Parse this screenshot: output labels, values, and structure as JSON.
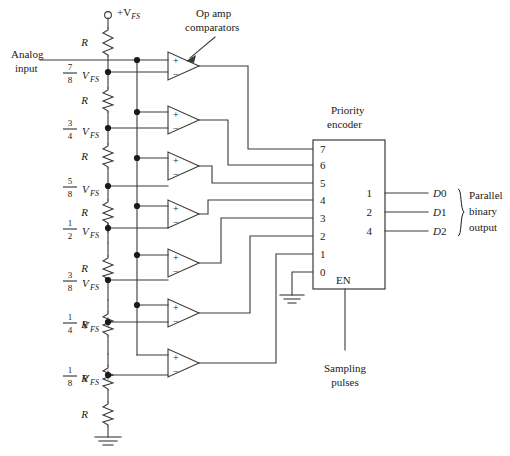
{
  "figure": {
    "type": "circuit-schematic"
  },
  "labels": {
    "analog_input_line1": "Analog",
    "analog_input_line2": "input",
    "supply": "+V",
    "supply_sub": "FS",
    "opamp_line1": "Op amp",
    "opamp_line2": "comparators",
    "encoder_line1": "Priority",
    "encoder_line2": "encoder",
    "enable": "EN",
    "sampling_line1": "Sampling",
    "sampling_line2": "pulses",
    "output_line1": "Parallel",
    "output_line2": "binary",
    "output_line3": "output",
    "resistor": "R"
  },
  "ladder": {
    "resistor_label": "R",
    "resistor_count": 8,
    "taps": [
      {
        "num": "7",
        "den": "8",
        "unit": "V",
        "sub": "FS"
      },
      {
        "num": "3",
        "den": "4",
        "unit": "V",
        "sub": "FS"
      },
      {
        "num": "5",
        "den": "8",
        "unit": "V",
        "sub": "FS"
      },
      {
        "num": "1",
        "den": "2",
        "unit": "V",
        "sub": "FS"
      },
      {
        "num": "3",
        "den": "8",
        "unit": "V",
        "sub": "FS"
      },
      {
        "num": "1",
        "den": "4",
        "unit": "V",
        "sub": "FS"
      },
      {
        "num": "1",
        "den": "8",
        "unit": "V",
        "sub": "FS"
      }
    ]
  },
  "comparators": {
    "count": 7,
    "plus": "+",
    "minus": "−"
  },
  "encoder": {
    "name_line1": "Priority",
    "name_line2": "encoder",
    "inputs": [
      "7",
      "6",
      "5",
      "4",
      "3",
      "2",
      "1",
      "0"
    ],
    "outputs": [
      "1",
      "2",
      "4"
    ],
    "enable_label": "EN"
  },
  "outputs": {
    "pins": [
      {
        "label": "D",
        "index": "0"
      },
      {
        "label": "D",
        "index": "1"
      },
      {
        "label": "D",
        "index": "2"
      }
    ],
    "group_line1": "Parallel",
    "group_line2": "binary",
    "group_line3": "output"
  },
  "colors": {
    "wire": "#3a3a3a",
    "ink": "#1a1a1a",
    "background": "#ffffff"
  }
}
